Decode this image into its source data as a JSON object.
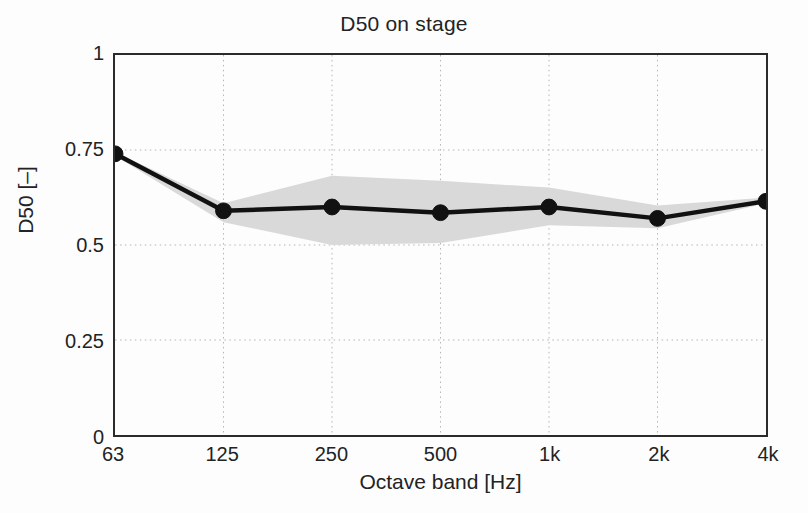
{
  "chart_data": {
    "type": "line",
    "title": "D50 on stage",
    "xlabel": "Octave band [Hz]",
    "ylabel": "D50 [–]",
    "categories": [
      "63",
      "125",
      "250",
      "500",
      "1k",
      "2k",
      "4k"
    ],
    "x_tick_labels": [
      "63",
      "125",
      "250",
      "500",
      "1k",
      "2k",
      "4k"
    ],
    "y_tick_labels": [
      "0",
      "0.25",
      "0.5",
      "0.75",
      "1"
    ],
    "y_tick_values": [
      0,
      0.25,
      0.5,
      0.75,
      1
    ],
    "ylim": [
      0,
      1
    ],
    "xlim": [
      0,
      6
    ],
    "grid": true,
    "grid_style": "dotted",
    "legend": "none",
    "series": [
      {
        "name": "D50 mean",
        "values": [
          0.74,
          0.59,
          0.6,
          0.585,
          0.6,
          0.57,
          0.615
        ],
        "marker": "filled-circle",
        "color": "#111111"
      }
    ],
    "band": {
      "name": "spread",
      "upper": [
        0.745,
        0.61,
        0.682,
        0.669,
        0.651,
        0.604,
        0.625
      ],
      "lower": [
        0.735,
        0.56,
        0.5,
        0.505,
        0.552,
        0.544,
        0.61
      ],
      "color": "#d9d9d9"
    },
    "colors": {
      "line": "#111111",
      "marker": "#111111",
      "band": "#d9d9d9",
      "axis": "#2b2b2b",
      "grid": "#b4b4b4",
      "background": "#fdfdfd",
      "text": "#232323"
    }
  }
}
